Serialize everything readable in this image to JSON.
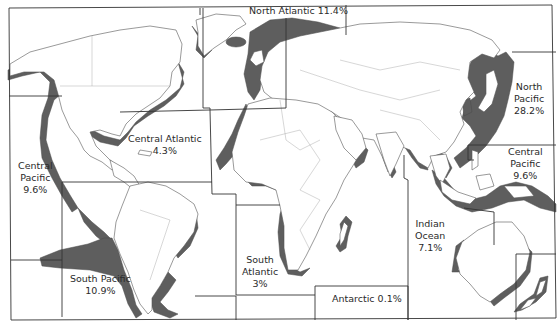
{
  "map": {
    "shade_color": "#5e5e5e",
    "land_color": "#ffffff",
    "boundary_color": "#333333"
  },
  "regions": {
    "north_atlantic": {
      "name": "North Atlantic",
      "value": "11.4%"
    },
    "central_atlantic": {
      "name": "Central Atlantic",
      "value": "4.3%"
    },
    "central_pacific_west": {
      "name_line1": "Central",
      "name_line2": "Pacific",
      "value": "9.6%"
    },
    "south_pacific": {
      "name": "South Pacific",
      "value": "10.9%"
    },
    "south_atlantic": {
      "name_line1": "South",
      "name_line2": "Atlantic",
      "value": "3%"
    },
    "antarctic": {
      "name": "Antarctic",
      "value": "0.1%"
    },
    "indian_ocean": {
      "name_line1": "Indian",
      "name_line2": "Ocean",
      "value": "7.1%"
    },
    "north_pacific": {
      "name_line1": "North",
      "name_line2": "Pacific",
      "value": "28.2%"
    },
    "central_pacific_east": {
      "name_line1": "Central",
      "name_line2": "Pacific",
      "value": "9.6%"
    }
  }
}
